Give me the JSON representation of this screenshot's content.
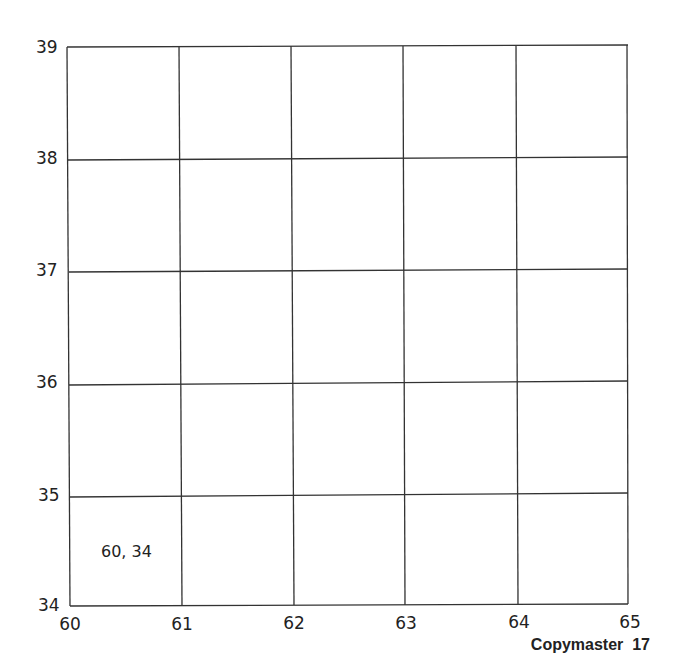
{
  "grid": {
    "x_labels": [
      "60",
      "61",
      "62",
      "63",
      "64",
      "65"
    ],
    "y_labels": [
      "39",
      "38",
      "37",
      "36",
      "35",
      "34"
    ],
    "line_color": "#333333"
  },
  "cell_label": "60, 34",
  "footer": "Copymaster  17"
}
